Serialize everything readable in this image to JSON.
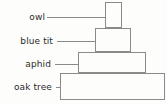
{
  "diagram": {
    "type": "ecological-pyramid",
    "style": {
      "stroke_color": "#8a8a8a",
      "fill_color": "#fdfdfc",
      "leader_color": "#8a8a8a",
      "text_color": "#2b2b2b",
      "background": "#ffffff"
    },
    "tiers": [
      {
        "id": "owl",
        "label": "owl",
        "level": 4,
        "role": "tertiary consumer",
        "block": {
          "x": 105,
          "y": 2,
          "width": 17,
          "height": 26
        },
        "leader": {
          "x1": 47,
          "x2": 105,
          "y": 17
        },
        "label_anchor": {
          "right": 45,
          "top": 13
        }
      },
      {
        "id": "blue-tit",
        "label": "blue tit",
        "level": 3,
        "role": "secondary consumer",
        "block": {
          "x": 95,
          "y": 28,
          "width": 36,
          "height": 24
        },
        "leader": {
          "x1": 57,
          "x2": 95,
          "y": 41
        },
        "label_anchor": {
          "right": 53,
          "top": 37
        }
      },
      {
        "id": "aphid",
        "label": "aphid",
        "level": 2,
        "role": "primary consumer",
        "block": {
          "x": 78,
          "y": 52,
          "width": 68,
          "height": 21
        },
        "leader": {
          "x1": 55,
          "x2": 78,
          "y": 64
        },
        "label_anchor": {
          "right": 51,
          "top": 60
        }
      },
      {
        "id": "oak-tree",
        "label": "oak tree",
        "level": 1,
        "role": "producer",
        "block": {
          "x": 60,
          "y": 73,
          "width": 105,
          "height": 27
        },
        "leader": {
          "x1": 56,
          "x2": 60,
          "y": 87
        },
        "label_anchor": {
          "right": 52,
          "top": 83
        }
      }
    ]
  }
}
